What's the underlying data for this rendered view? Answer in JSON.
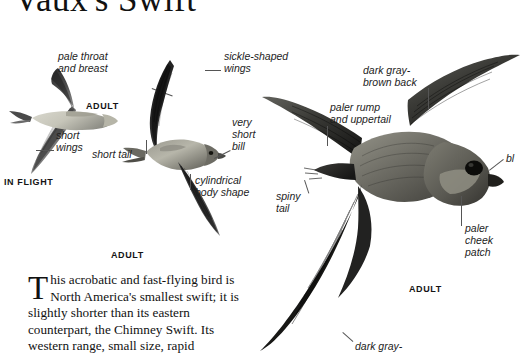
{
  "page": {
    "title": "Vaux's Swift",
    "background": "#ffffff",
    "ink": "#1a1a1a"
  },
  "figures": {
    "in_flight_section_label": "IN FLIGHT",
    "left_bird": {
      "caption": "ADULT",
      "labels": [
        {
          "id": "pale-throat-and-breast",
          "text": "pale throat\nand breast"
        },
        {
          "id": "short-wings",
          "text": "short\nwings"
        }
      ]
    },
    "middle_bird": {
      "caption": "ADULT",
      "labels": [
        {
          "id": "sickle-shaped-wings",
          "text": "sickle-shaped\nwings"
        },
        {
          "id": "very-short-bill",
          "text": "very\nshort\nbill"
        },
        {
          "id": "short-tail",
          "text": "short tail"
        },
        {
          "id": "cylindrical-body-shape",
          "text": "cylindrical\nbody shape"
        }
      ]
    },
    "right_bird": {
      "caption": "ADULT",
      "labels": [
        {
          "id": "dark-gray-brown-back",
          "text": "dark gray-\nbrown back"
        },
        {
          "id": "paler-rump-and-uppertail",
          "text": "paler rump\nand uppertail"
        },
        {
          "id": "spiny-tail",
          "text": "spiny\ntail"
        },
        {
          "id": "blackish-eye",
          "text": "bl"
        },
        {
          "id": "paler-cheek-patch",
          "text": "paler cheek\npatch"
        },
        {
          "id": "dark-gray-bottom",
          "text": "dark gray-"
        }
      ]
    }
  },
  "article": {
    "dropcap": "T",
    "paragraph": "his acrobatic and fast-flying bird is North America's smallest swift; it is slightly shorter than its eastern counterpart, the Chimney Swift. Its western range, small size, rapid"
  },
  "colors": {
    "leader_line": "#555555",
    "plumage_dark": "#2b2b2b",
    "plumage_mid": "#6f6f6f",
    "plumage_pale": "#c9c9c2"
  }
}
